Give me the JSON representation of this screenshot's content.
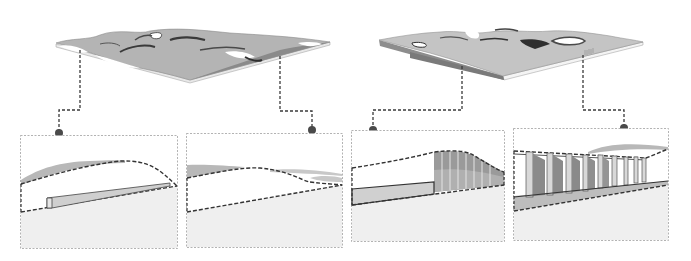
{
  "diagram": {
    "kind": "architectural terrain-roof concept diagram",
    "colors": {
      "background": "#ffffff",
      "roof_gray": "#b4b4b4",
      "roof_dark": "#6f6f6f",
      "ground_fill": "#efefef",
      "panel_border": "#9a9a9a",
      "leader_line": "#3a3a3a",
      "dot": "#4a4a4a",
      "section_line": "#333333",
      "wall_fill": "#cfcfcf",
      "column_fill": "#d8d8d8",
      "shadow_fill": "#8a8a8a"
    },
    "overviews": [
      {
        "id": "terrain-left",
        "label": "Landscape roof model A",
        "callouts": [
          "detail-1",
          "detail-2"
        ]
      },
      {
        "id": "terrain-right",
        "label": "Landscape roof model B",
        "callouts": [
          "detail-3",
          "detail-4"
        ]
      }
    ],
    "detail_panels": [
      {
        "id": "detail-1",
        "content": "Section: mounded roof over low ramp wall"
      },
      {
        "id": "detail-2",
        "content": "Section: gently undulating roof over sloped ground"
      },
      {
        "id": "detail-3",
        "content": "Section: solid wall transitioning to glazed mullion facade"
      },
      {
        "id": "detail-4",
        "content": "Section: colonnade of columns under roof"
      }
    ]
  }
}
